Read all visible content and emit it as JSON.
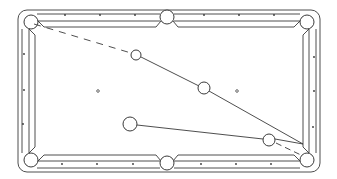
{
  "diagram": {
    "type": "billiards-table-shot-diagram",
    "colors": {
      "line": "#3a3a3a",
      "background": "#ffffff"
    },
    "table": {
      "x": 18,
      "y": 10,
      "width": 302,
      "height": 162,
      "rail_width": 14
    },
    "pockets": [
      {
        "name": "top-left",
        "cx": 31,
        "cy": 22
      },
      {
        "name": "top-center",
        "cx": 167,
        "cy": 17
      },
      {
        "name": "top-right",
        "cx": 307,
        "cy": 22
      },
      {
        "name": "bottom-left",
        "cx": 31,
        "cy": 160
      },
      {
        "name": "bottom-center",
        "cx": 167,
        "cy": 163
      },
      {
        "name": "bottom-right",
        "cx": 307,
        "cy": 160
      }
    ],
    "balls": [
      {
        "name": "ghost-ball",
        "cx": 136,
        "cy": 55,
        "r": 5
      },
      {
        "name": "object-ball-2",
        "cx": 204,
        "cy": 88,
        "r": 6
      },
      {
        "name": "cue-ball",
        "cx": 130,
        "cy": 124,
        "r": 7
      },
      {
        "name": "object-ball-1",
        "cx": 269,
        "cy": 140,
        "r": 6
      }
    ],
    "spots": [
      {
        "name": "head-spot",
        "cx": 98,
        "cy": 91
      },
      {
        "name": "foot-spot",
        "cx": 237,
        "cy": 91
      }
    ],
    "paths": [
      {
        "name": "dashed-path-to-top-left-pocket",
        "x1": 34,
        "y1": 24,
        "x2": 131,
        "y2": 53,
        "style": "dashed"
      },
      {
        "name": "line-ghost-to-ball",
        "x1": 141,
        "y1": 57,
        "x2": 199,
        "y2": 86,
        "style": "solid"
      },
      {
        "name": "line-ball-to-rail",
        "x1": 209,
        "y1": 91,
        "x2": 303,
        "y2": 144,
        "style": "solid"
      },
      {
        "name": "line-cue-to-object",
        "x1": 137,
        "y1": 125,
        "x2": 263,
        "y2": 139,
        "style": "solid"
      },
      {
        "name": "line-object-to-rail",
        "x1": 275,
        "y1": 139,
        "x2": 303,
        "y2": 144,
        "style": "solid"
      },
      {
        "name": "dashed-path-to-bottom-right-pocket",
        "x1": 275,
        "y1": 143,
        "x2": 303,
        "y2": 156,
        "style": "dashed"
      }
    ]
  }
}
